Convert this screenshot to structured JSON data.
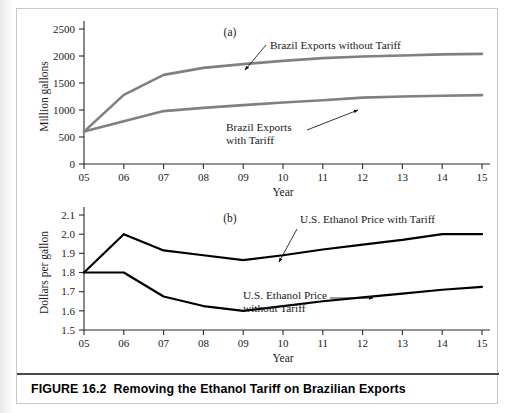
{
  "caption": {
    "figure_number": "FIGURE 16.2",
    "title": "Removing the Ethanol Tariff on Brazilian Exports"
  },
  "chart_data": [
    {
      "type": "line",
      "panel_label": "(a)",
      "title": "",
      "xlabel": "Year",
      "ylabel": "Million gallons",
      "categories": [
        "05",
        "06",
        "07",
        "08",
        "09",
        "10",
        "11",
        "12",
        "13",
        "14",
        "15"
      ],
      "x": [
        2005,
        2006,
        2007,
        2008,
        2009,
        2010,
        2011,
        2012,
        2013,
        2014,
        2015
      ],
      "xlim": [
        2005,
        2015
      ],
      "ylim": [
        0,
        2500
      ],
      "yticks": [
        "0",
        "500",
        "1000",
        "1500",
        "2000",
        "2500"
      ],
      "ytick_values": [
        0,
        500,
        1000,
        1500,
        2000,
        2500
      ],
      "grid": false,
      "legend_position": "inline-annotations",
      "line_color": "#808080",
      "series": [
        {
          "name": "Brazil Exports without Tariff",
          "values": [
            600,
            1280,
            1650,
            1780,
            1850,
            1910,
            1960,
            1990,
            2010,
            2030,
            2040
          ],
          "color": "#808080"
        },
        {
          "name": "Brazil Exports with Tariff",
          "values": [
            600,
            790,
            980,
            1040,
            1090,
            1140,
            1180,
            1230,
            1250,
            1265,
            1275
          ],
          "color": "#808080"
        }
      ],
      "annotations": [
        {
          "text": "Brazil Exports without Tariff",
          "lines": [
            "Brazil Exports without Tariff"
          ],
          "points_to_year": 2009
        },
        {
          "text": "Brazil Exports with Tariff",
          "lines": [
            "Brazil Exports",
            "with Tariff"
          ],
          "points_to_year": 2012
        }
      ]
    },
    {
      "type": "line",
      "panel_label": "(b)",
      "title": "",
      "xlabel": "Year",
      "ylabel": "Dollars per gallon",
      "categories": [
        "05",
        "06",
        "07",
        "08",
        "09",
        "10",
        "11",
        "12",
        "13",
        "14",
        "15"
      ],
      "x": [
        2005,
        2006,
        2007,
        2008,
        2009,
        2010,
        2011,
        2012,
        2013,
        2014,
        2015
      ],
      "xlim": [
        2005,
        2015
      ],
      "ylim": [
        1.5,
        2.1
      ],
      "yticks": [
        "1.5",
        "1.6",
        "1.7",
        "1.8",
        "1.9",
        "2.0",
        "2.1"
      ],
      "ytick_values": [
        1.5,
        1.6,
        1.7,
        1.8,
        1.9,
        2.0,
        2.1
      ],
      "grid": false,
      "legend_position": "inline-annotations",
      "line_color": "#000000",
      "series": [
        {
          "name": "U.S. Ethanol Price with Tariff",
          "values": [
            1.8,
            2.0,
            1.915,
            1.89,
            1.865,
            1.89,
            1.92,
            1.945,
            1.97,
            2.0,
            2.0
          ],
          "color": "#000000"
        },
        {
          "name": "U.S. Ethanol Price without Tariff",
          "values": [
            1.8,
            1.8,
            1.675,
            1.625,
            1.6,
            1.625,
            1.65,
            1.67,
            1.69,
            1.71,
            1.725
          ],
          "color": "#000000"
        }
      ],
      "annotations": [
        {
          "text": "U.S. Ethanol Price with Tariff",
          "lines": [
            "U.S. Ethanol Price with Tariff"
          ],
          "points_to_year": 2009
        },
        {
          "text": "U.S. Ethanol Price without Tariff",
          "lines": [
            "U.S. Ethanol Price",
            "without Tariff"
          ],
          "points_to_year": 2012
        }
      ]
    }
  ]
}
